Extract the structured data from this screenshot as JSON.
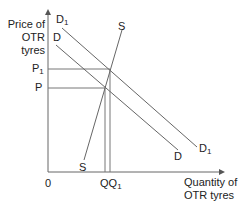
{
  "diagram": {
    "type": "supply-demand",
    "y_axis_label": [
      "Price of",
      "OTR",
      "tyres"
    ],
    "x_axis_label": [
      "Quantity of",
      "OTR tyres"
    ],
    "origin": "0",
    "price_labels": {
      "p1": "P",
      "p1_sub": "1",
      "p": "P"
    },
    "quantity_labels": {
      "q": "Q",
      "q1": "Q",
      "q1_sub": "1"
    },
    "curves": {
      "d1": {
        "label": "D",
        "sub": "1"
      },
      "d": {
        "label": "D"
      },
      "s": {
        "label": "S"
      }
    },
    "colors": {
      "line": "#666666",
      "text": "#222222"
    }
  }
}
